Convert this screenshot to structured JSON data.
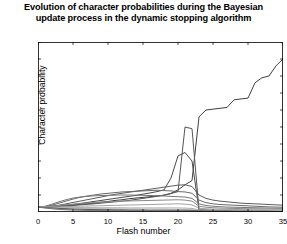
{
  "chart_data": {
    "type": "line",
    "title": "Evolution of character probabilities during the Bayesian update process in the dynamic stopping algorithm",
    "title_line1": "Evolution of character probabilities during the Bayesian",
    "title_line2": "update process in the dynamic stopping algorithm",
    "xlabel": "Flash number",
    "ylabel": "Character probability",
    "xlim": [
      0,
      35
    ],
    "ylim": [
      0,
      1
    ],
    "xticks": [
      0,
      5,
      10,
      15,
      20,
      25,
      30,
      35
    ],
    "xtick_labels": [
      "0",
      "5",
      "10",
      "15",
      "20",
      "25",
      "30",
      "35"
    ],
    "yticks": [
      0,
      0.1,
      0.2,
      0.3,
      0.4,
      0.5,
      0.6,
      0.7,
      0.8,
      0.9,
      1
    ],
    "ytick_labels": [
      "0",
      "0.1",
      "0.2",
      "0.3",
      "0.4",
      "0.5",
      "0.6",
      "0.7",
      "0.8",
      "0.9",
      "1"
    ],
    "grid": false,
    "legend": "none",
    "x": [
      0,
      1,
      2,
      3,
      4,
      5,
      6,
      7,
      8,
      9,
      10,
      11,
      12,
      13,
      14,
      15,
      16,
      17,
      18,
      19,
      20,
      21,
      22,
      23,
      24,
      25,
      26,
      27,
      28,
      29,
      30,
      31,
      32,
      33,
      34,
      35
    ],
    "series": [
      {
        "name": "target-character",
        "color": "#404040",
        "width": 1.0,
        "values": [
          0.028,
          0.03,
          0.032,
          0.035,
          0.038,
          0.04,
          0.045,
          0.048,
          0.052,
          0.058,
          0.062,
          0.068,
          0.072,
          0.078,
          0.082,
          0.086,
          0.09,
          0.094,
          0.098,
          0.11,
          0.13,
          0.16,
          0.185,
          0.56,
          0.6,
          0.605,
          0.61,
          0.615,
          0.66,
          0.665,
          0.67,
          0.76,
          0.79,
          0.8,
          0.86,
          0.9
        ]
      },
      {
        "name": "competitor-character-a",
        "color": "#4a4a4a",
        "width": 1.0,
        "values": [
          0.028,
          0.03,
          0.033,
          0.036,
          0.04,
          0.044,
          0.05,
          0.056,
          0.062,
          0.068,
          0.074,
          0.08,
          0.086,
          0.092,
          0.098,
          0.105,
          0.112,
          0.12,
          0.13,
          0.2,
          0.33,
          0.35,
          0.3,
          0.015,
          0.012,
          0.01,
          0.009,
          0.008,
          0.008,
          0.007,
          0.007,
          0.006,
          0.006,
          0.005,
          0.005,
          0.004
        ]
      },
      {
        "name": "competitor-character-b",
        "color": "#555555",
        "width": 1.0,
        "values": [
          0.028,
          0.029,
          0.031,
          0.033,
          0.036,
          0.038,
          0.042,
          0.045,
          0.048,
          0.052,
          0.056,
          0.06,
          0.064,
          0.068,
          0.074,
          0.08,
          0.086,
          0.092,
          0.1,
          0.108,
          0.12,
          0.5,
          0.49,
          0.012,
          0.01,
          0.009,
          0.008,
          0.008,
          0.007,
          0.007,
          0.006,
          0.006,
          0.005,
          0.005,
          0.004,
          0.004
        ]
      },
      {
        "name": "competitor-character-c",
        "color": "#5c5c5c",
        "width": 1.0,
        "values": [
          0.028,
          0.03,
          0.034,
          0.04,
          0.048,
          0.056,
          0.064,
          0.072,
          0.08,
          0.088,
          0.096,
          0.104,
          0.11,
          0.116,
          0.122,
          0.128,
          0.134,
          0.14,
          0.146,
          0.152,
          0.158,
          0.16,
          0.15,
          0.1,
          0.08,
          0.07,
          0.064,
          0.06,
          0.056,
          0.052,
          0.05,
          0.048,
          0.046,
          0.044,
          0.042,
          0.04
        ]
      },
      {
        "name": "competitor-character-d",
        "color": "#6a6a6a",
        "width": 1.0,
        "values": [
          0.028,
          0.032,
          0.04,
          0.052,
          0.064,
          0.076,
          0.086,
          0.094,
          0.1,
          0.106,
          0.11,
          0.114,
          0.118,
          0.12,
          0.122,
          0.124,
          0.126,
          0.128,
          0.126,
          0.124,
          0.12,
          0.118,
          0.11,
          0.07,
          0.055,
          0.048,
          0.044,
          0.042,
          0.04,
          0.038,
          0.036,
          0.034,
          0.032,
          0.03,
          0.029,
          0.028
        ]
      },
      {
        "name": "competitor-character-e",
        "color": "#777777",
        "width": 1.0,
        "values": [
          0.028,
          0.034,
          0.046,
          0.06,
          0.072,
          0.082,
          0.088,
          0.092,
          0.095,
          0.097,
          0.098,
          0.099,
          0.1,
          0.1,
          0.099,
          0.098,
          0.097,
          0.096,
          0.094,
          0.092,
          0.09,
          0.088,
          0.08,
          0.048,
          0.038,
          0.034,
          0.031,
          0.029,
          0.028,
          0.027,
          0.026,
          0.025,
          0.024,
          0.023,
          0.022,
          0.022
        ]
      },
      {
        "name": "competitor-character-f",
        "color": "#8a8a8a",
        "width": 1.0,
        "values": [
          0.028,
          0.03,
          0.034,
          0.038,
          0.042,
          0.046,
          0.05,
          0.053,
          0.056,
          0.058,
          0.06,
          0.062,
          0.064,
          0.065,
          0.066,
          0.067,
          0.068,
          0.069,
          0.07,
          0.071,
          0.072,
          0.07,
          0.064,
          0.034,
          0.028,
          0.025,
          0.023,
          0.022,
          0.021,
          0.02,
          0.019,
          0.019,
          0.018,
          0.018,
          0.017,
          0.017
        ]
      },
      {
        "name": "low-group-1",
        "color": "#999999",
        "width": 0.9,
        "values": [
          0.028,
          0.029,
          0.03,
          0.031,
          0.032,
          0.033,
          0.034,
          0.035,
          0.036,
          0.037,
          0.038,
          0.039,
          0.04,
          0.041,
          0.042,
          0.043,
          0.044,
          0.045,
          0.046,
          0.047,
          0.048,
          0.046,
          0.042,
          0.022,
          0.019,
          0.017,
          0.016,
          0.015,
          0.015,
          0.014,
          0.014,
          0.013,
          0.013,
          0.012,
          0.012,
          0.012
        ]
      },
      {
        "name": "low-group-2",
        "color": "#a6a6a6",
        "width": 0.9,
        "values": [
          0.028,
          0.028,
          0.028,
          0.027,
          0.027,
          0.027,
          0.026,
          0.026,
          0.026,
          0.025,
          0.025,
          0.025,
          0.025,
          0.024,
          0.024,
          0.024,
          0.024,
          0.024,
          0.024,
          0.024,
          0.024,
          0.023,
          0.021,
          0.013,
          0.012,
          0.011,
          0.01,
          0.01,
          0.01,
          0.009,
          0.009,
          0.009,
          0.009,
          0.008,
          0.008,
          0.008
        ]
      },
      {
        "name": "low-group-3",
        "color": "#b0b0b0",
        "width": 0.9,
        "values": [
          0.028,
          0.027,
          0.026,
          0.025,
          0.024,
          0.023,
          0.022,
          0.021,
          0.02,
          0.02,
          0.019,
          0.019,
          0.018,
          0.018,
          0.018,
          0.017,
          0.017,
          0.017,
          0.017,
          0.016,
          0.016,
          0.016,
          0.015,
          0.009,
          0.008,
          0.008,
          0.007,
          0.007,
          0.007,
          0.007,
          0.006,
          0.006,
          0.006,
          0.006,
          0.006,
          0.006
        ]
      },
      {
        "name": "low-group-4",
        "color": "#3a3a3a",
        "width": 1.0,
        "values": [
          0.028,
          0.026,
          0.023,
          0.021,
          0.019,
          0.017,
          0.016,
          0.015,
          0.014,
          0.013,
          0.013,
          0.012,
          0.012,
          0.011,
          0.011,
          0.011,
          0.01,
          0.01,
          0.01,
          0.01,
          0.01,
          0.01,
          0.009,
          0.006,
          0.005,
          0.005,
          0.005,
          0.005,
          0.004,
          0.004,
          0.004,
          0.004,
          0.004,
          0.004,
          0.003,
          0.003
        ]
      },
      {
        "name": "low-group-5",
        "color": "#888888",
        "width": 0.9,
        "values": [
          0.028,
          0.025,
          0.021,
          0.018,
          0.016,
          0.014,
          0.013,
          0.012,
          0.011,
          0.01,
          0.01,
          0.009,
          0.009,
          0.009,
          0.008,
          0.008,
          0.008,
          0.008,
          0.008,
          0.008,
          0.008,
          0.007,
          0.007,
          0.004,
          0.004,
          0.003,
          0.003,
          0.003,
          0.003,
          0.003,
          0.003,
          0.003,
          0.003,
          0.002,
          0.002,
          0.002
        ]
      },
      {
        "name": "low-group-6",
        "color": "#707070",
        "width": 0.9,
        "values": [
          0.028,
          0.024,
          0.019,
          0.015,
          0.013,
          0.011,
          0.01,
          0.009,
          0.008,
          0.008,
          0.007,
          0.007,
          0.007,
          0.006,
          0.006,
          0.006,
          0.006,
          0.006,
          0.006,
          0.006,
          0.006,
          0.005,
          0.005,
          0.003,
          0.003,
          0.002,
          0.002,
          0.002,
          0.002,
          0.002,
          0.002,
          0.002,
          0.002,
          0.002,
          0.002,
          0.002
        ]
      }
    ]
  }
}
